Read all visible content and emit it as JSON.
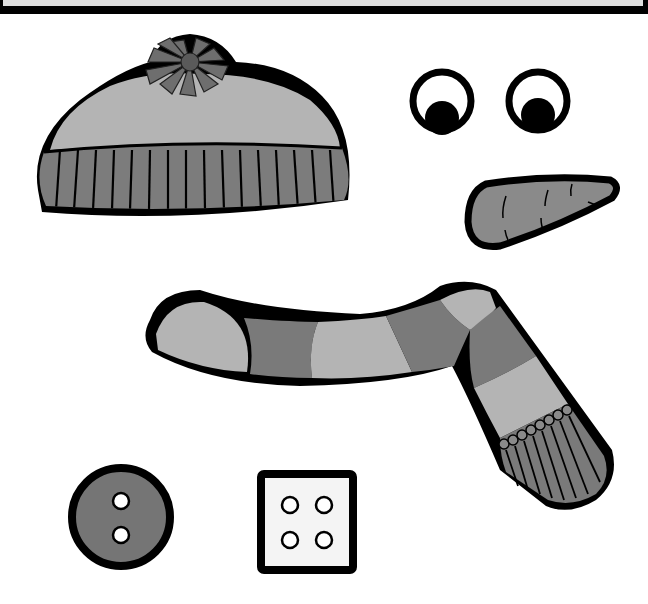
{
  "canvas": {
    "width": 648,
    "height": 604,
    "background": "#ffffff"
  },
  "top_bar": {
    "fill": "#dedede",
    "border": "#000000"
  },
  "colors": {
    "outline": "#000000",
    "light_gray": "#b4b4b4",
    "mid_gray": "#8c8c8c",
    "dark_gray": "#6a6a6a",
    "white": "#ffffff",
    "box_fill": "#f4f4f4"
  },
  "pieces": [
    {
      "id": "hat",
      "label": "Knit hat with pom-pom",
      "x": 34,
      "y": 32,
      "w": 322,
      "h": 182
    },
    {
      "id": "eye-left",
      "label": "Left eye",
      "cx": 442,
      "cy": 101,
      "r": 32
    },
    {
      "id": "eye-right",
      "label": "Right eye",
      "cx": 538,
      "cy": 101,
      "r": 32
    },
    {
      "id": "carrot-nose",
      "label": "Carrot nose",
      "x": 464,
      "y": 174,
      "w": 154,
      "h": 78
    },
    {
      "id": "scarf",
      "label": "Striped scarf",
      "x": 140,
      "y": 272,
      "w": 476,
      "h": 240
    },
    {
      "id": "button-round",
      "label": "Round button, 2 holes",
      "cx": 121,
      "cy": 517,
      "r": 53
    },
    {
      "id": "button-square",
      "label": "Square button, 4 holes",
      "x": 257,
      "y": 470,
      "w": 100,
      "h": 104
    }
  ]
}
